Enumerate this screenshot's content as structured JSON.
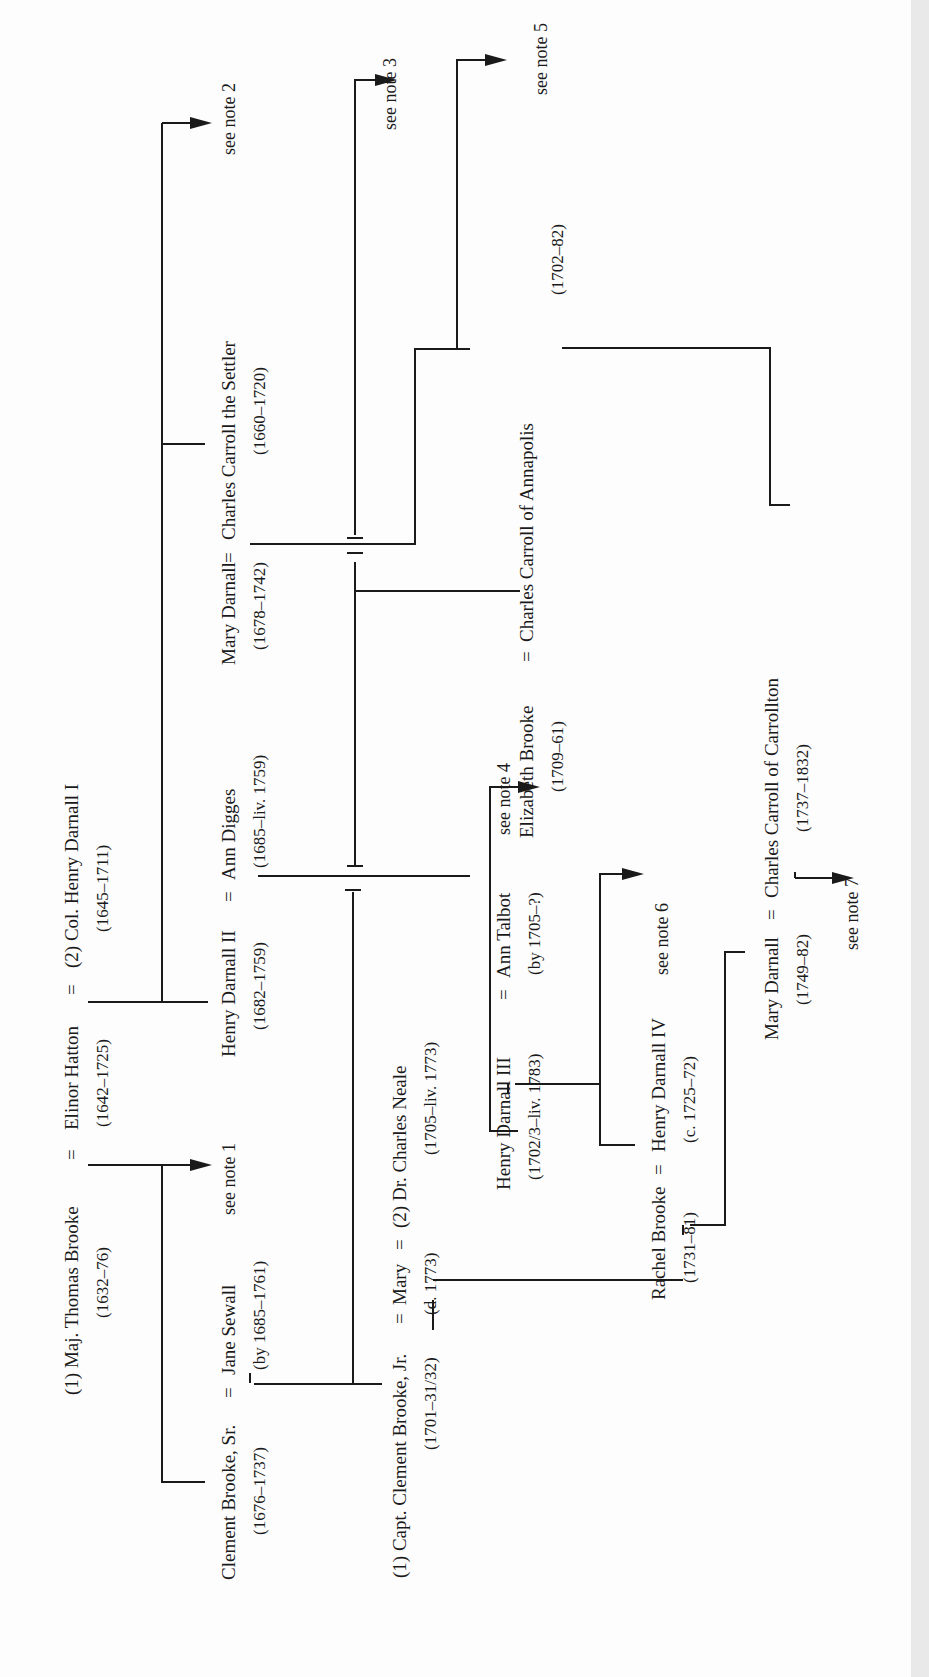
{
  "diagram": {
    "type": "genealogy-tree",
    "orientation": "rotated-90-ccw",
    "couples": [
      {
        "id": "c1",
        "label": "(1) Maj. Thomas Brooke = Elinor Hatton = (2) Col. Henry Darnall I",
        "persons": [
          {
            "name": "(1) Maj. Thomas Brooke",
            "dates": "(1632–76)"
          },
          {
            "name": "Elinor Hatton",
            "dates": "(1642–1725)"
          },
          {
            "name": "(2) Col. Henry Darnall I",
            "dates": "(1645–1711)"
          }
        ]
      },
      {
        "id": "c2",
        "label": "Clement Brooke, Sr. = Jane Sewall",
        "persons": [
          {
            "name": "Clement Brooke, Sr.",
            "dates": "(1676–1737)"
          },
          {
            "name": "Jane Sewall",
            "dates": "(by 1685–1761)"
          }
        ]
      },
      {
        "id": "c3",
        "label": "Henry Darnall II = Ann Digges",
        "persons": [
          {
            "name": "Henry Darnall II",
            "dates": "(1682–1759)"
          },
          {
            "name": "Ann Digges",
            "dates": "(1685–liv. 1759)"
          }
        ]
      },
      {
        "id": "c4",
        "label": "Mary Darnall = Charles Carroll the Settler",
        "persons": [
          {
            "name": "Mary Darnall",
            "dates": "(1678–1742)"
          },
          {
            "name": "Charles Carroll the Settler",
            "dates": "(1660–1720)"
          }
        ]
      },
      {
        "id": "c5",
        "label": "(1) Capt. Clement Brooke, Jr. = Mary = (2) Dr. Charles Neale",
        "persons": [
          {
            "name": "(1) Capt. Clement Brooke, Jr.",
            "dates": "(1701–31/32)"
          },
          {
            "name": "Mary",
            "dates": "(d. 1773)"
          },
          {
            "name": "(2) Dr. Charles Neale",
            "dates": "(1705–liv. 1773)"
          }
        ]
      },
      {
        "id": "c6",
        "label": "Henry Darnall III = Ann Talbot",
        "persons": [
          {
            "name": "Henry Darnall III",
            "dates": "(1702/3–liv. 1783)"
          },
          {
            "name": "Ann Talbot",
            "dates": "(by 1705–?)"
          }
        ]
      },
      {
        "id": "c7",
        "label": "Elizabeth Brooke = Charles Carroll of Annapolis",
        "persons": [
          {
            "name": "Elizabeth Brooke",
            "dates": "(1709–61)"
          },
          {
            "name": "Charles Carroll of Annapolis",
            "dates": "(1702–82)"
          }
        ]
      },
      {
        "id": "c8",
        "label": "Rachel Brooke = Henry Darnall IV",
        "persons": [
          {
            "name": "Rachel Brooke",
            "dates": "(1731–81)"
          },
          {
            "name": "Henry Darnall IV",
            "dates": "(c. 1725–72)"
          }
        ]
      },
      {
        "id": "c9",
        "label": "Mary Darnall = Charles Carroll of Carrollton",
        "persons": [
          {
            "name": "Mary Darnall",
            "dates": "(1749–82)"
          },
          {
            "name": "Charles Carroll of Carrollton",
            "dates": "(1737–1832)"
          }
        ]
      }
    ],
    "notes": [
      "see note 1",
      "see note 2",
      "see note 3",
      "see note 4",
      "see note 5",
      "see note 6",
      "see note 7"
    ],
    "line_color": "#1a1a1a",
    "background": "#fdfdfd"
  }
}
